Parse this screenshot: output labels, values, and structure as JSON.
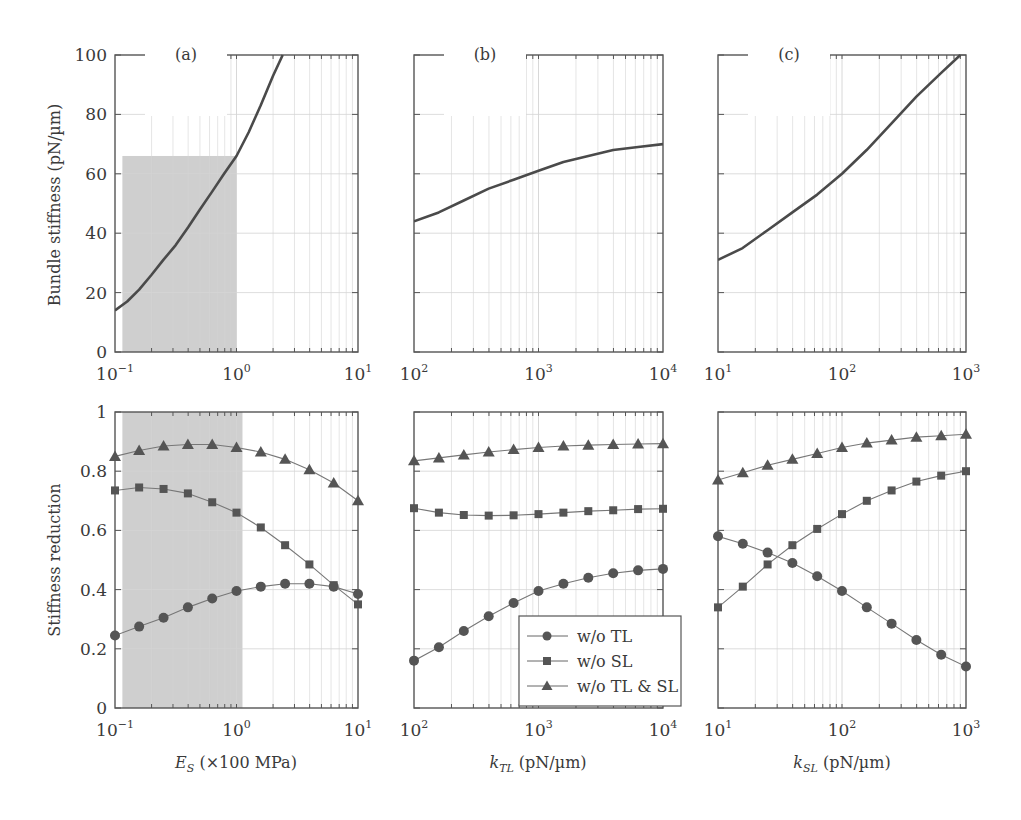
{
  "chart_data": [
    {
      "id": "a_top",
      "panel_label": "(a)",
      "type": "line",
      "title": "",
      "xlabel": "",
      "ylabel": "Bundle stiffness (pN/µm)",
      "xscale": "log",
      "xlim": [
        0.1,
        10
      ],
      "ylim": [
        0,
        100
      ],
      "xticks": [
        {
          "v": 0.1,
          "base": "10",
          "exp": "−1"
        },
        {
          "v": 1,
          "base": "10",
          "exp": "0"
        },
        {
          "v": 10,
          "base": "10",
          "exp": "1"
        }
      ],
      "yticks": [
        0,
        20,
        40,
        60,
        80,
        100
      ],
      "grid": true,
      "shaded_region": {
        "x": [
          0.115,
          1.0
        ],
        "y": [
          0,
          66
        ]
      },
      "series": [
        {
          "name": "Bundle stiffness",
          "marker": "none",
          "x": [
            0.1,
            0.126,
            0.158,
            0.2,
            0.25,
            0.316,
            0.4,
            0.5,
            0.63,
            0.79,
            1.0,
            1.26,
            1.58,
            2.0,
            2.4
          ],
          "values": [
            14,
            17,
            21,
            26,
            31,
            36,
            42,
            48,
            54,
            60,
            66,
            74,
            83,
            93,
            100
          ]
        }
      ]
    },
    {
      "id": "b_top",
      "panel_label": "(b)",
      "type": "line",
      "xlabel": "",
      "ylabel": "",
      "xscale": "log",
      "xlim": [
        100,
        10000
      ],
      "ylim": [
        0,
        100
      ],
      "xticks": [
        {
          "v": 100,
          "base": "10",
          "exp": "2"
        },
        {
          "v": 1000,
          "base": "10",
          "exp": "3"
        },
        {
          "v": 10000,
          "base": "10",
          "exp": "4"
        }
      ],
      "yticks": [
        0,
        20,
        40,
        60,
        80,
        100
      ],
      "grid": true,
      "series": [
        {
          "name": "Bundle stiffness",
          "marker": "none",
          "x": [
            100,
            158,
            251,
            398,
            631,
            1000,
            1585,
            2512,
            3981,
            6310,
            10000
          ],
          "values": [
            44,
            47,
            51,
            55,
            58,
            61,
            64,
            66,
            68,
            69,
            70
          ]
        }
      ]
    },
    {
      "id": "c_top",
      "panel_label": "(c)",
      "type": "line",
      "xlabel": "",
      "ylabel": "",
      "xscale": "log",
      "xlim": [
        10,
        1000
      ],
      "ylim": [
        0,
        100
      ],
      "xticks": [
        {
          "v": 10,
          "base": "10",
          "exp": "1"
        },
        {
          "v": 100,
          "base": "10",
          "exp": "2"
        },
        {
          "v": 1000,
          "base": "10",
          "exp": "3"
        }
      ],
      "yticks": [
        0,
        20,
        40,
        60,
        80,
        100
      ],
      "grid": true,
      "series": [
        {
          "name": "Bundle stiffness",
          "marker": "none",
          "x": [
            10,
            15.8,
            25.1,
            39.8,
            63.1,
            100,
            158,
            251,
            398,
            631,
            900
          ],
          "values": [
            31,
            35,
            41,
            47,
            53,
            60,
            68,
            77,
            86,
            94,
            100
          ]
        }
      ]
    },
    {
      "id": "a_bottom",
      "type": "line",
      "xlabel": "E_S (×100 MPa)",
      "ylabel": "Stiffness reduction",
      "xscale": "log",
      "xlim": [
        0.1,
        10
      ],
      "ylim": [
        0,
        1
      ],
      "xticks": [
        {
          "v": 0.1,
          "base": "10",
          "exp": "−1"
        },
        {
          "v": 1,
          "base": "10",
          "exp": "0"
        },
        {
          "v": 10,
          "base": "10",
          "exp": "1"
        }
      ],
      "yticks": [
        0,
        0.2,
        0.4,
        0.6,
        0.8,
        1
      ],
      "grid": true,
      "shaded_region": {
        "x": [
          0.115,
          1.12
        ],
        "y": [
          0,
          1
        ]
      },
      "x": [
        0.1,
        0.158,
        0.251,
        0.398,
        0.631,
        1.0,
        1.585,
        2.512,
        3.981,
        6.31,
        10.0
      ],
      "series": [
        {
          "name": "w/o TL",
          "marker": "circle",
          "values": [
            0.245,
            0.275,
            0.305,
            0.34,
            0.37,
            0.395,
            0.41,
            0.42,
            0.42,
            0.41,
            0.385
          ]
        },
        {
          "name": "w/o SL",
          "marker": "square",
          "values": [
            0.735,
            0.745,
            0.74,
            0.725,
            0.695,
            0.66,
            0.61,
            0.55,
            0.485,
            0.415,
            0.35
          ]
        },
        {
          "name": "w/o TL & SL",
          "marker": "triangle",
          "values": [
            0.85,
            0.87,
            0.885,
            0.89,
            0.89,
            0.88,
            0.865,
            0.84,
            0.805,
            0.76,
            0.7
          ]
        }
      ]
    },
    {
      "id": "b_bottom",
      "type": "line",
      "xlabel": "k_TL (pN/µm)",
      "ylabel": "",
      "xscale": "log",
      "xlim": [
        100,
        10000
      ],
      "ylim": [
        0,
        1
      ],
      "xticks": [
        {
          "v": 100,
          "base": "10",
          "exp": "2"
        },
        {
          "v": 1000,
          "base": "10",
          "exp": "3"
        },
        {
          "v": 10000,
          "base": "10",
          "exp": "4"
        }
      ],
      "yticks": [
        0,
        0.2,
        0.4,
        0.6,
        0.8,
        1
      ],
      "grid": true,
      "legend": {
        "position": "lower right"
      },
      "x": [
        100,
        158.5,
        251.2,
        398.1,
        631,
        1000,
        1585,
        2512,
        3981,
        6310,
        10000
      ],
      "series": [
        {
          "name": "w/o TL",
          "marker": "circle",
          "values": [
            0.16,
            0.205,
            0.26,
            0.31,
            0.355,
            0.395,
            0.42,
            0.44,
            0.455,
            0.465,
            0.47
          ]
        },
        {
          "name": "w/o SL",
          "marker": "square",
          "values": [
            0.675,
            0.66,
            0.652,
            0.65,
            0.651,
            0.655,
            0.66,
            0.665,
            0.668,
            0.672,
            0.673
          ]
        },
        {
          "name": "w/o TL & SL",
          "marker": "triangle",
          "values": [
            0.835,
            0.845,
            0.855,
            0.865,
            0.873,
            0.88,
            0.885,
            0.888,
            0.89,
            0.892,
            0.893
          ]
        }
      ]
    },
    {
      "id": "c_bottom",
      "type": "line",
      "xlabel": "k_SL (pN/µm)",
      "ylabel": "",
      "xscale": "log",
      "xlim": [
        10,
        1000
      ],
      "ylim": [
        0,
        1
      ],
      "xticks": [
        {
          "v": 10,
          "base": "10",
          "exp": "1"
        },
        {
          "v": 100,
          "base": "10",
          "exp": "2"
        },
        {
          "v": 1000,
          "base": "10",
          "exp": "3"
        }
      ],
      "yticks": [
        0,
        0.2,
        0.4,
        0.6,
        0.8,
        1
      ],
      "grid": true,
      "x": [
        10,
        15.85,
        25.12,
        39.81,
        63.1,
        100,
        158.5,
        251.2,
        398.1,
        631,
        1000
      ],
      "series": [
        {
          "name": "w/o TL",
          "marker": "circle",
          "values": [
            0.58,
            0.555,
            0.525,
            0.49,
            0.445,
            0.395,
            0.34,
            0.285,
            0.23,
            0.18,
            0.14
          ]
        },
        {
          "name": "w/o SL",
          "marker": "square",
          "values": [
            0.34,
            0.41,
            0.485,
            0.55,
            0.605,
            0.655,
            0.7,
            0.735,
            0.765,
            0.785,
            0.8
          ]
        },
        {
          "name": "w/o TL & SL",
          "marker": "triangle",
          "values": [
            0.77,
            0.795,
            0.82,
            0.84,
            0.86,
            0.88,
            0.895,
            0.905,
            0.915,
            0.92,
            0.925
          ]
        }
      ]
    }
  ],
  "labels": {
    "ylabel_top": "Bundle stiffness (pN/µm)",
    "ylabel_bottom": "Stiffness reduction",
    "xlabel_a_main": "E",
    "xlabel_a_sub": "S",
    "xlabel_a_rest": " (×100 MPa)",
    "xlabel_b_main": "k",
    "xlabel_b_sub": "TL",
    "xlabel_b_rest": " (pN/µm)",
    "xlabel_c_main": "k",
    "xlabel_c_sub": "SL",
    "xlabel_c_rest": " (pN/µm)"
  },
  "legend": {
    "items": [
      {
        "label": "w/o TL",
        "marker": "circle"
      },
      {
        "label": "w/o SL",
        "marker": "square"
      },
      {
        "label": "w/o TL & SL",
        "marker": "triangle"
      }
    ]
  },
  "colors": {
    "axis": "#555555",
    "grid": "#d4d4d4",
    "curve": "#4a4a4a",
    "shade": "#cfcfcf",
    "marker": "#555555"
  }
}
